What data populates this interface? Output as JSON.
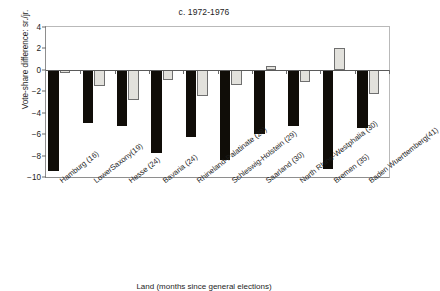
{
  "chart_data": {
    "type": "bar",
    "title": "c. 1972-1976",
    "xlabel": "Land (months since general elections)",
    "ylabel": "Vote-share difference: sr./jr.",
    "ylim": [
      -10,
      4
    ],
    "yticks": [
      4,
      2,
      0,
      -2,
      -4,
      -6,
      -8,
      -10
    ],
    "ytick_labels": [
      "4",
      "2",
      "0",
      "−2",
      "−4",
      "−6",
      "−8",
      "−10"
    ],
    "grid": false,
    "legend": "none",
    "categories": [
      "Hamburg (16)",
      "LowerSaxony(19)",
      "Hesse (24)",
      "Bavaria (24)",
      "Rhineland-Palatinate (28)",
      "Schleswig-Holstein (29)",
      "Saarland (30)",
      "North Rhine-Westphalia (30)",
      "Bremen (35)",
      "Baden Wuerttemberg(41)"
    ],
    "series": [
      {
        "name": "senior partner",
        "color": "#100d08",
        "values": [
          -9.4,
          -5.0,
          -5.2,
          -7.8,
          -6.3,
          -8.4,
          -6.0,
          -5.2,
          -9.3,
          -5.4
        ]
      },
      {
        "name": "junior partner",
        "color": "#e2e1dc",
        "values": [
          -0.3,
          -1.5,
          -2.8,
          -0.95,
          -2.45,
          -1.45,
          0.35,
          -1.1,
          2.0,
          -2.25
        ]
      }
    ]
  }
}
